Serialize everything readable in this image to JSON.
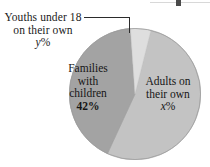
{
  "chart_data": {
    "type": "pie",
    "title": "",
    "subtitle": "",
    "legend_position": "in-slice",
    "grid": false,
    "categories": [
      "Families with children",
      "Adults on their own",
      "Youths under 18 on their own"
    ],
    "values": [
      42,
      53,
      5
    ],
    "value_labels": [
      "42%",
      "x%",
      "y%"
    ],
    "slices": [
      {
        "name": "families-with-children",
        "label_lines": [
          "Families",
          "with",
          "children"
        ],
        "value_label": "42%",
        "value": 42,
        "color": "#a3a3a3",
        "label_placement": "inside"
      },
      {
        "name": "adults-on-their-own",
        "label_lines": [
          "Adults on",
          "their own"
        ],
        "value_label": "x%",
        "value_symbol": "x",
        "value": 53,
        "color": "#c3c3c3",
        "label_placement": "inside"
      },
      {
        "name": "youths-under-18-on-their-own",
        "label_lines": [
          "Youths under 18",
          "on their own"
        ],
        "value_label": "y%",
        "value_symbol": "y",
        "value": 5,
        "color": "#dedede",
        "label_placement": "callout"
      }
    ]
  },
  "callout": {
    "line1": "Youths under 18",
    "line2": "on their own",
    "symbol": "y",
    "percent_sign": "%"
  },
  "families_label": {
    "line1": "Families",
    "line2": "with",
    "line3": "children",
    "value": "42",
    "percent_sign": "%"
  },
  "adults_label": {
    "line1": "Adults on",
    "line2": "their own",
    "symbol": "x",
    "percent_sign": "%"
  },
  "colors": {
    "families": "#a3a3a3",
    "adults": "#c3c3c3",
    "youths": "#dedede",
    "outline": "#8a8a8a",
    "leader": "#2b2b2b",
    "text": "#161616",
    "background": "#ffffff"
  }
}
